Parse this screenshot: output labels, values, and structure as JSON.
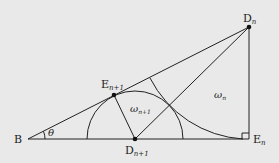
{
  "diagram": {
    "points": {
      "B": {
        "label": "B",
        "x": 28,
        "y": 139
      },
      "Dn": {
        "label": "D",
        "sub": "n",
        "x": 249,
        "y": 27
      },
      "En": {
        "label": "E",
        "sub": "n",
        "x": 249,
        "y": 139
      },
      "Dn1": {
        "label": "D",
        "sub": "n+1",
        "x": 135,
        "y": 139
      },
      "En1": {
        "label": "E",
        "sub": "n+1",
        "x": 114,
        "y": 95
      }
    },
    "angle_label": "θ",
    "region_labels": {
      "omega_n": {
        "sym": "ω",
        "sub": "n"
      },
      "omega_n1": {
        "sym": "ω",
        "sub": "n+1"
      }
    },
    "colors": {
      "background": "#e9e9e9",
      "stroke": "#222222"
    }
  }
}
